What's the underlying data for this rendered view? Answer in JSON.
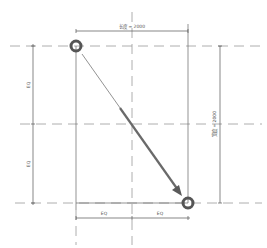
{
  "diagram": {
    "dimensions": {
      "top": "长度 = 2000",
      "right": "宽度 = 2000",
      "left_upper": "EQ",
      "left_lower": "EQ",
      "bottom_left": "EQ",
      "bottom_right": "EQ"
    },
    "colors": {
      "line": "#555555",
      "dash": "#999999",
      "arrow": "#666666",
      "circle": "#555555"
    }
  }
}
